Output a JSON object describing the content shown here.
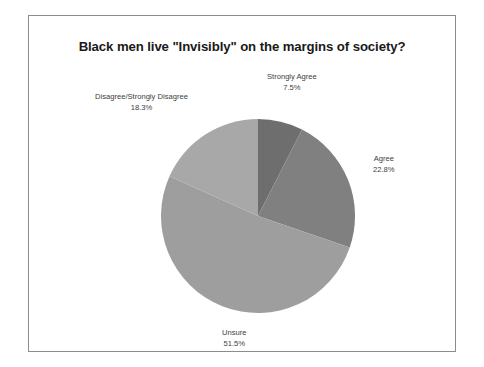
{
  "chart": {
    "title": "Black men live \"Invisibly\" on the margins of society?",
    "frame_border_color": "#8c8c8c",
    "background_color": "#ffffff"
  },
  "labels": {
    "strongly_agree": {
      "name": "Strongly Agree",
      "pct": "7.5%"
    },
    "agree": {
      "name": "Agree",
      "pct": "22.8%"
    },
    "unsure": {
      "name": "Unsure",
      "pct": "51.5%"
    },
    "disagree": {
      "name": "Disagree/Strongly Disagree",
      "pct": "18.3%"
    }
  },
  "chart_data": {
    "type": "pie",
    "title": "Black men live \"Invisibly\" on the margins of society?",
    "categories": [
      "Strongly Agree",
      "Agree",
      "Unsure",
      "Disagree/Strongly Disagree"
    ],
    "values": [
      7.5,
      22.8,
      51.5,
      18.3
    ],
    "value_labels": [
      "7.5%",
      "22.8%",
      "51.5%",
      "18.3%"
    ],
    "unit": "percent",
    "total": 100.1,
    "start_angle_deg": 0,
    "direction": "clockwise",
    "colors": [
      "#6e6e6e",
      "#808080",
      "#9e9e9e",
      "#a8a8a8"
    ],
    "legend": "none",
    "labels_position": "outside",
    "grid": false
  }
}
